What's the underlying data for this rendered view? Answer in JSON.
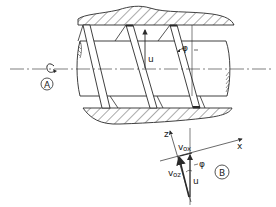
{
  "diagram": {
    "title": "",
    "colors": {
      "line": "#2a2a2a",
      "background": "#ffffff"
    },
    "labels": {
      "view_a": "A",
      "view_b": "B",
      "velocity_u_top": "u",
      "helix_angle_top": "φ",
      "axis_z": "z",
      "axis_x": "x",
      "velocity_vox": "v",
      "velocity_vox_sub": "ox",
      "velocity_voz": "v",
      "velocity_voz_sub": "oz",
      "angle_phi_b": "φ",
      "velocity_u_b": "u"
    },
    "components": [
      "barrel-top-hatched",
      "barrel-bottom-hatched",
      "screw-shaft",
      "screw-flight-1",
      "screw-flight-2",
      "screw-flight-3",
      "centerline",
      "rotation-arrow",
      "velocity-vector-diagram"
    ]
  }
}
